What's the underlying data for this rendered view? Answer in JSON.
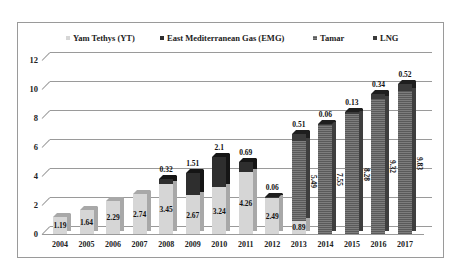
{
  "chart_data": {
    "type": "bar",
    "stacked": true,
    "style": "3d-column",
    "title": "",
    "xlabel": "",
    "ylabel": "",
    "ylim": [
      0,
      12
    ],
    "yticks": [
      "0",
      "2",
      "4",
      "6",
      "8",
      "10",
      "12"
    ],
    "grid": true,
    "legend_position": "top",
    "categories": [
      "2004",
      "2005",
      "2006",
      "2007",
      "2008",
      "2009",
      "2010",
      "2011",
      "2012",
      "2013",
      "2014",
      "2015",
      "2016",
      "2017"
    ],
    "series": [
      {
        "name": "Yam Tethys (YT)",
        "color": "#d6d6d6",
        "values": [
          1.19,
          1.64,
          2.29,
          2.74,
          3.45,
          2.67,
          3.24,
          4.26,
          2.49,
          0.89,
          0,
          0,
          0,
          0
        ]
      },
      {
        "name": "East Mediterranean Gas (EMG)",
        "color": "#2e2e2e",
        "values": [
          0,
          0,
          0,
          0,
          0.32,
          1.51,
          2.1,
          0.69,
          0,
          0,
          0,
          0,
          0,
          0
        ]
      },
      {
        "name": "Tamar",
        "color": "#6a6a6a",
        "values": [
          0,
          0,
          0,
          0,
          0,
          0,
          0,
          0,
          0,
          5.49,
          7.55,
          8.28,
          9.32,
          9.83
        ]
      },
      {
        "name": "LNG",
        "color": "#3a3a3a",
        "values": [
          0,
          0,
          0,
          0,
          0,
          0,
          0,
          0,
          0.06,
          0.51,
          0.06,
          0.13,
          0.34,
          0.52
        ]
      }
    ],
    "data_labels": {
      "2004": [
        "1.19"
      ],
      "2005": [
        "1.64"
      ],
      "2006": [
        "2.29"
      ],
      "2007": [
        "2.74"
      ],
      "2008": [
        "3.45",
        "0.32"
      ],
      "2009": [
        "2.67",
        "1.51"
      ],
      "2010": [
        "3.24",
        "2.1"
      ],
      "2011": [
        "4.26",
        "0.69"
      ],
      "2012": [
        "2.49",
        "0.06"
      ],
      "2013": [
        "0.89",
        "5.49",
        "0.51"
      ],
      "2014": [
        "7.55",
        "0.06"
      ],
      "2015": [
        "8.28",
        "0.13"
      ],
      "2016": [
        "9.32",
        "0.34"
      ],
      "2017": [
        "9.83",
        "0.52"
      ]
    }
  },
  "legend": [
    {
      "label": "Yam Tethys (YT)",
      "color": "#d6d6d6"
    },
    {
      "label": "East Mediterranean Gas (EMG)",
      "color": "#2e2e2e"
    },
    {
      "label": "Tamar",
      "color": "#6a6a6a"
    },
    {
      "label": "LNG",
      "color": "#3a3a3a"
    }
  ]
}
